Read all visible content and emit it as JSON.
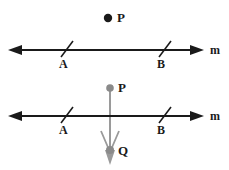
{
  "figure": {
    "colors": {
      "line": "#1a1a1a",
      "text": "#1a1a1a",
      "construction": "#8a8a8a",
      "background": "#ffffff"
    },
    "panels": [
      {
        "name": "upper-panel",
        "line_label": "m",
        "point_labels": [
          "P"
        ],
        "tick_labels": [
          "A",
          "B"
        ],
        "points": [
          {
            "id": "P",
            "label": "P",
            "x": 108,
            "y": 18,
            "color": "#1a1a1a",
            "filled": true
          }
        ],
        "line": {
          "id": "m",
          "label": "m",
          "x1": 10,
          "y1": 50,
          "x2": 205,
          "y2": 50
        },
        "ticks": [
          {
            "id": "A",
            "label": "A",
            "x": 65,
            "y": 50
          },
          {
            "id": "B",
            "label": "B",
            "x": 163,
            "y": 50
          }
        ]
      },
      {
        "name": "lower-panel",
        "line_label": "m",
        "point_labels": [
          "P",
          "Q"
        ],
        "tick_labels": [
          "A",
          "B"
        ],
        "points": [
          {
            "id": "P",
            "label": "P",
            "x": 110,
            "y": 88,
            "color": "#8a8a8a",
            "filled": true
          },
          {
            "id": "Q",
            "label": "Q",
            "x": 110,
            "y": 150,
            "color": "#8a8a8a",
            "filled": true
          }
        ],
        "line": {
          "id": "m",
          "label": "m",
          "x1": 10,
          "y1": 116,
          "x2": 205,
          "y2": 116
        },
        "ticks": [
          {
            "id": "A",
            "label": "A",
            "x": 65,
            "y": 116
          },
          {
            "id": "B",
            "label": "B",
            "x": 163,
            "y": 116
          }
        ],
        "construction_segment": {
          "from": "P",
          "to": "Q",
          "x": 110,
          "y1": 88,
          "y2": 160
        }
      }
    ]
  }
}
